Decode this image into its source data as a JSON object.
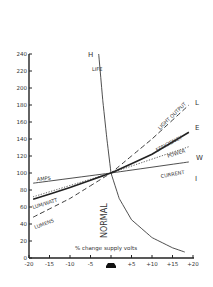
{
  "chart_data": {
    "type": "line",
    "title": "",
    "xlabel": "% change supply volts",
    "ylabel": "change in values %",
    "xlim": [
      -20,
      20
    ],
    "ylim": [
      0,
      240
    ],
    "x_ticks": [
      "-20",
      "-15",
      "-10",
      "-5",
      "",
      "+5",
      "+10",
      "+15",
      "+20"
    ],
    "y_ticks": [
      "0",
      "20",
      "40",
      "60",
      "80",
      "100",
      "120",
      "140",
      "160",
      "180",
      "200",
      "220",
      "240"
    ],
    "grid": false,
    "normal_label": "NORMAL",
    "series": [
      {
        "name": "LIFE",
        "letter": "H",
        "style": "solid-thin",
        "x": [
          -3,
          -2,
          -1,
          0,
          2,
          5,
          10,
          15,
          18
        ],
        "y": [
          240,
          185,
          140,
          100,
          70,
          45,
          24,
          12,
          7
        ]
      },
      {
        "name": "LIGHT OUTPUT",
        "letter": "L",
        "style": "dashed",
        "x": [
          -19,
          -10,
          0,
          10,
          19
        ],
        "y": [
          48,
          70,
          100,
          140,
          180
        ]
      },
      {
        "name": "EFFICIENCY",
        "letter": "E",
        "style": "solid-thick",
        "x": [
          -19,
          -10,
          0,
          10,
          19
        ],
        "y": [
          69,
          83,
          100,
          122,
          148
        ]
      },
      {
        "name": "POWER",
        "letter": "W",
        "style": "dotted",
        "x": [
          -19,
          0,
          19
        ],
        "y": [
          72,
          100,
          131
        ]
      },
      {
        "name": "CURRENT",
        "letter": "I",
        "style": "solid-thin",
        "x": [
          -19,
          0,
          19
        ],
        "y": [
          88,
          100,
          113
        ]
      }
    ],
    "annotations": [
      "AMPS",
      "LUM/WATT",
      "LUMENS",
      "LIFE",
      "LIGHT OUTPUT",
      "EFFICIENCY",
      "POWER",
      "CURRENT",
      "H",
      "L",
      "E",
      "W",
      "I",
      "NORMAL"
    ]
  },
  "labels": {
    "ylabel": "change in values %",
    "xlabel": "% change supply volts",
    "normal": "NORMAL",
    "life": "LIFE",
    "H": "H",
    "L": "L",
    "E": "E",
    "W": "W",
    "I": "I",
    "light_output": "LIGHT OUTPUT",
    "efficiency": "EFFICIENCY",
    "power": "POWER",
    "current": "CURRENT",
    "amps": "AMPS",
    "lumwatt": "LUM/WATT",
    "lumens": "LUMENS"
  }
}
